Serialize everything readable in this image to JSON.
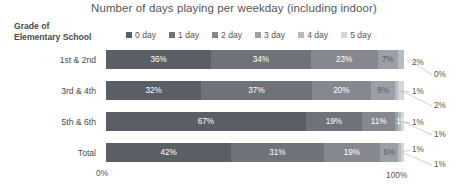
{
  "chart_data": {
    "type": "bar",
    "orientation": "horizontal",
    "stacked": true,
    "normalized_percent": true,
    "title": "Number of days playing per weekday (including indoor)",
    "xlabel": "",
    "ylabel": "Grade of Elementary School",
    "xlim": [
      0,
      100
    ],
    "x_tick_labels": [
      "0%",
      "100%"
    ],
    "grid": false,
    "legend_position": "top",
    "categories": [
      "1st & 2nd",
      "3rd & 4th",
      "5th & 6th",
      "Total"
    ],
    "series": [
      {
        "name": "0 day",
        "color": "#5a5f66",
        "values": [
          36,
          32,
          67,
          42
        ]
      },
      {
        "name": "1 day",
        "color": "#6e737a",
        "values": [
          34,
          37,
          19,
          31
        ]
      },
      {
        "name": "2 day",
        "color": "#85898f",
        "values": [
          23,
          20,
          11,
          19
        ]
      },
      {
        "name": "3 day",
        "color": "#9aa0a6",
        "values": [
          7,
          8,
          1,
          6
        ]
      },
      {
        "name": "4 day",
        "color": "#b6bbc0",
        "values": [
          2,
          1,
          1,
          1
        ]
      },
      {
        "name": "5 day",
        "color": "#d3d7da",
        "values": [
          0,
          2,
          1,
          1
        ]
      }
    ],
    "data_labels": [
      [
        "36%",
        "34%",
        "23%",
        "7%",
        "2%",
        "0%"
      ],
      [
        "32%",
        "37%",
        "20%",
        "8%",
        "1%",
        "2%"
      ],
      [
        "67%",
        "19%",
        "11%",
        "1%",
        "1%",
        "1%"
      ],
      [
        "42%",
        "31%",
        "19%",
        "6%",
        "1%",
        "1%"
      ]
    ]
  },
  "header": {
    "title": "Number of days playing per weekday (including indoor)",
    "axis_title_line1": "Grade of",
    "axis_title_line2": "Elementary School"
  },
  "legend": {
    "items": [
      {
        "label": "0 day",
        "color": "#5a5f66"
      },
      {
        "label": "1 day",
        "color": "#6e737a"
      },
      {
        "label": "2 day",
        "color": "#85898f"
      },
      {
        "label": "3 day",
        "color": "#9aa0a6"
      },
      {
        "label": "4 day",
        "color": "#b6bbc0"
      },
      {
        "label": "5 day",
        "color": "#d3d7da"
      }
    ]
  },
  "rows": [
    {
      "label": "1st & 2nd",
      "inline": [
        "36%",
        "34%",
        "23%",
        "7%"
      ],
      "callouts": [
        "2%",
        "0%"
      ]
    },
    {
      "label": "3rd & 4th",
      "inline": [
        "32%",
        "37%",
        "20%",
        "8%"
      ],
      "callouts": [
        "1%",
        "2%"
      ]
    },
    {
      "label": "5th & 6th",
      "inline": [
        "67%",
        "19%",
        "11%",
        "1%"
      ],
      "callouts": [
        "1%",
        "1%"
      ]
    },
    {
      "label": "Total",
      "inline": [
        "42%",
        "31%",
        "19%",
        "6%"
      ],
      "callouts": [
        "1%",
        "1%"
      ]
    }
  ],
  "axis": {
    "start_label": "0%",
    "end_label": "100%"
  }
}
